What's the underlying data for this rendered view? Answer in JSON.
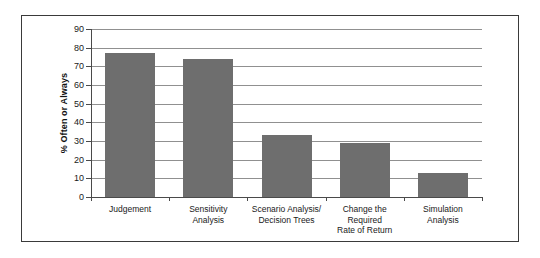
{
  "chart_data": {
    "type": "bar",
    "title": "",
    "xlabel": "",
    "ylabel": "% Often or Always",
    "ylim": [
      0,
      90
    ],
    "ytick_step": 10,
    "yticks": [
      90,
      80,
      70,
      60,
      50,
      40,
      30,
      20,
      10,
      0
    ],
    "grid": true,
    "legend": "none",
    "bar_color": "#6e6e6e",
    "categories": [
      "Judgement",
      "Sensitivity Analysis",
      "Scenario Analysis/ Decision Trees",
      "Change the Required Rate of Return",
      "Simulation Analysis"
    ],
    "category_lines": [
      [
        "Judgement",
        ""
      ],
      [
        "Sensitivity",
        "Analysis"
      ],
      [
        "Scenario Analysis/",
        "Decision Trees"
      ],
      [
        "Change the Required",
        "Rate of Return"
      ],
      [
        "Simulation",
        "Analysis"
      ]
    ],
    "values": [
      77,
      74,
      33,
      29,
      13
    ]
  },
  "axis": {
    "y_title": "% Often or Always"
  }
}
